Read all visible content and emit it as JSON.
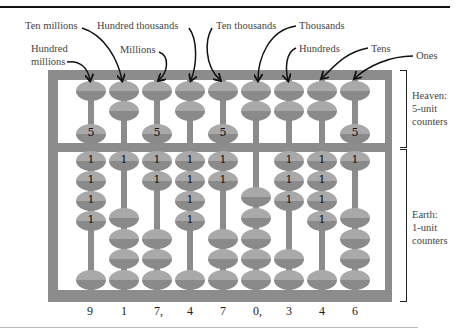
{
  "labels": {
    "ten_millions": "Ten millions",
    "hundred_millions": "Hundred millions",
    "hundred_millions_l1": "Hundred",
    "hundred_millions_l2": "millions",
    "millions": "Millions",
    "hundred_thousands": "Hundred thousands",
    "ten_thousands": "Ten thousands",
    "thousands": "Thousands",
    "hundreds": "Hundreds",
    "tens": "Tens",
    "ones": "Ones"
  },
  "side_labels": {
    "heaven_l1": "Heaven:",
    "heaven_l2": "5-unit",
    "heaven_l3": "counters",
    "earth_l1": "Earth:",
    "earth_l2": "1-unit",
    "earth_l3": "counters"
  },
  "bead_labels": {
    "heaven": "5",
    "earth": "1"
  },
  "digits": [
    "9",
    "1",
    "7,",
    "4",
    "7",
    "0,",
    "3",
    "4",
    "6"
  ],
  "number": "917,470,346",
  "colors": {
    "frame": "#8c8c8c",
    "bead_light": "#a9a9a9",
    "bead_dark": "#8a8a8a"
  }
}
